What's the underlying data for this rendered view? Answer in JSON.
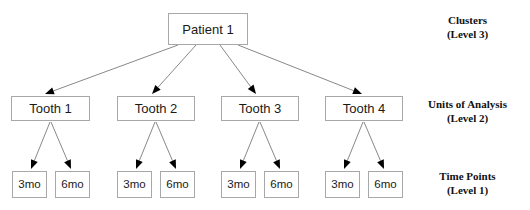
{
  "diagram": {
    "canvas": {
      "width": 530,
      "height": 210,
      "background": "#ffffff"
    },
    "style": {
      "box_border_color": "#a8a8a8",
      "box_fill_color": "#ffffff",
      "edge_color": "#7a7a7a",
      "arrowhead_color": "#000000",
      "text_color": "#1a1a1a",
      "label_color": "#111111"
    },
    "root": {
      "id": "patient-1",
      "label": "Patient 1",
      "x": 168,
      "y": 13,
      "w": 80,
      "h": 32
    },
    "units": [
      {
        "id": "tooth-1",
        "label": "Tooth 1",
        "x": 11,
        "y": 96,
        "w": 79,
        "h": 25
      },
      {
        "id": "tooth-2",
        "label": "Tooth 2",
        "x": 117,
        "y": 96,
        "w": 78,
        "h": 25
      },
      {
        "id": "tooth-3",
        "label": "Tooth 3",
        "x": 221,
        "y": 96,
        "w": 78,
        "h": 25
      },
      {
        "id": "tooth-4",
        "label": "Tooth 4",
        "x": 325,
        "y": 96,
        "w": 78,
        "h": 25
      }
    ],
    "time_points": [
      {
        "id": "t1-3mo",
        "parent": "tooth-1",
        "label": "3mo",
        "x": 12,
        "y": 171,
        "w": 35,
        "h": 27
      },
      {
        "id": "t1-6mo",
        "parent": "tooth-1",
        "label": "6mo",
        "x": 55,
        "y": 171,
        "w": 35,
        "h": 27
      },
      {
        "id": "t2-3mo",
        "parent": "tooth-2",
        "label": "3mo",
        "x": 117,
        "y": 171,
        "w": 35,
        "h": 27
      },
      {
        "id": "t2-6mo",
        "parent": "tooth-2",
        "label": "6mo",
        "x": 160,
        "y": 171,
        "w": 35,
        "h": 27
      },
      {
        "id": "t3-3mo",
        "parent": "tooth-3",
        "label": "3mo",
        "x": 221,
        "y": 171,
        "w": 35,
        "h": 27
      },
      {
        "id": "t3-6mo",
        "parent": "tooth-3",
        "label": "6mo",
        "x": 264,
        "y": 171,
        "w": 35,
        "h": 27
      },
      {
        "id": "t4-3mo",
        "parent": "tooth-4",
        "label": "3mo",
        "x": 325,
        "y": 171,
        "w": 35,
        "h": 27
      },
      {
        "id": "t4-6mo",
        "parent": "tooth-4",
        "label": "6mo",
        "x": 368,
        "y": 171,
        "w": 35,
        "h": 27
      }
    ],
    "level_labels": [
      {
        "id": "level-3",
        "name": "Clusters",
        "sub": "(Level 3)",
        "x": 410,
        "y": 14,
        "w": 115
      },
      {
        "id": "level-2",
        "name": "Units of Analysis",
        "sub": "(Level 2)",
        "x": 410,
        "y": 98,
        "w": 115
      },
      {
        "id": "level-1",
        "name": "Time Points",
        "sub": "(Level 1)",
        "x": 410,
        "y": 170,
        "w": 115
      }
    ],
    "edges": [
      {
        "id": "edge-patient-tooth-1",
        "from": "patient-1",
        "to": "tooth-1",
        "x1": 178,
        "y1": 45,
        "x2": 45,
        "y2": 94
      },
      {
        "id": "edge-patient-tooth-2",
        "from": "patient-1",
        "to": "tooth-2",
        "x1": 196,
        "y1": 45,
        "x2": 152,
        "y2": 94
      },
      {
        "id": "edge-patient-tooth-3",
        "from": "patient-1",
        "to": "tooth-3",
        "x1": 220,
        "y1": 45,
        "x2": 256,
        "y2": 94
      },
      {
        "id": "edge-patient-tooth-4",
        "from": "patient-1",
        "to": "tooth-4",
        "x1": 238,
        "y1": 45,
        "x2": 362,
        "y2": 94
      },
      {
        "id": "edge-tooth-1-3mo",
        "from": "tooth-1",
        "to": "t1-3mo",
        "x1": 50,
        "y1": 122,
        "x2": 31,
        "y2": 169
      },
      {
        "id": "edge-tooth-1-6mo",
        "from": "tooth-1",
        "to": "t1-6mo",
        "x1": 51,
        "y1": 122,
        "x2": 71,
        "y2": 169
      },
      {
        "id": "edge-tooth-2-3mo",
        "from": "tooth-2",
        "to": "t2-3mo",
        "x1": 155,
        "y1": 122,
        "x2": 136,
        "y2": 169
      },
      {
        "id": "edge-tooth-2-6mo",
        "from": "tooth-2",
        "to": "t2-6mo",
        "x1": 156,
        "y1": 122,
        "x2": 176,
        "y2": 169
      },
      {
        "id": "edge-tooth-3-3mo",
        "from": "tooth-3",
        "to": "t3-3mo",
        "x1": 259,
        "y1": 122,
        "x2": 240,
        "y2": 169
      },
      {
        "id": "edge-tooth-3-6mo",
        "from": "tooth-3",
        "to": "t3-6mo",
        "x1": 260,
        "y1": 122,
        "x2": 280,
        "y2": 169
      },
      {
        "id": "edge-tooth-4-3mo",
        "from": "tooth-4",
        "to": "t4-3mo",
        "x1": 363,
        "y1": 122,
        "x2": 344,
        "y2": 169
      },
      {
        "id": "edge-tooth-4-6mo",
        "from": "tooth-4",
        "to": "t4-6mo",
        "x1": 364,
        "y1": 122,
        "x2": 384,
        "y2": 169
      }
    ]
  }
}
